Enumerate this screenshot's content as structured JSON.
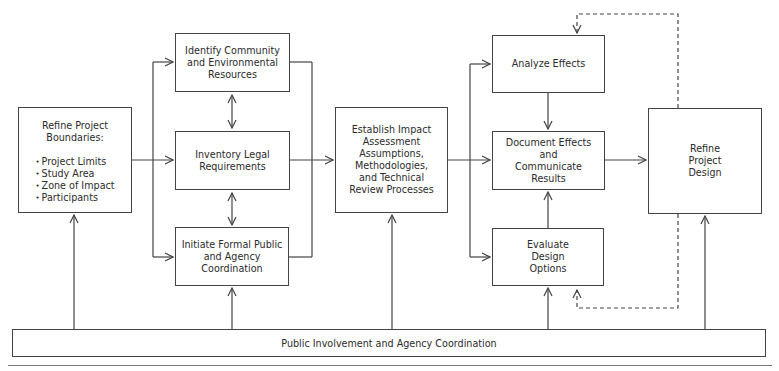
{
  "diagram": {
    "nodes": {
      "refine_boundaries": {
        "title": "Refine Project Boundaries:",
        "items": [
          "Project Limits",
          "Study Area",
          "Zone of Impact",
          "Participants"
        ]
      },
      "identify_resources": {
        "label": "Identify Community and Environmental Resources"
      },
      "inventory_legal": {
        "label": "Inventory Legal Requirements"
      },
      "initiate_coordination": {
        "label": "Initiate Formal Public and Agency Coordination"
      },
      "establish_assessment": {
        "label": "Establish Impact Assessment Assumptions, Methodologies, and Technical Review Processes"
      },
      "analyze_effects": {
        "label": "Analyze Effects"
      },
      "document_effects": {
        "label": "Document Effects and Communicate Results"
      },
      "evaluate_design": {
        "label": "Evaluate Design Options"
      },
      "refine_design": {
        "label": "Refine Project Design"
      },
      "public_involvement": {
        "label": "Public Involvement and Agency Coordination"
      }
    },
    "edges": [
      {
        "from": "refine_boundaries",
        "to": "identify_resources",
        "style": "solid"
      },
      {
        "from": "refine_boundaries",
        "to": "inventory_legal",
        "style": "solid"
      },
      {
        "from": "refine_boundaries",
        "to": "initiate_coordination",
        "style": "solid"
      },
      {
        "from": "identify_resources",
        "to": "inventory_legal",
        "style": "solid",
        "bidirectional": true
      },
      {
        "from": "inventory_legal",
        "to": "initiate_coordination",
        "style": "solid",
        "bidirectional": true
      },
      {
        "from": "identify_resources",
        "to": "establish_assessment",
        "style": "solid"
      },
      {
        "from": "inventory_legal",
        "to": "establish_assessment",
        "style": "solid"
      },
      {
        "from": "initiate_coordination",
        "to": "establish_assessment",
        "style": "solid"
      },
      {
        "from": "establish_assessment",
        "to": "analyze_effects",
        "style": "solid"
      },
      {
        "from": "establish_assessment",
        "to": "document_effects",
        "style": "solid"
      },
      {
        "from": "establish_assessment",
        "to": "evaluate_design",
        "style": "solid"
      },
      {
        "from": "analyze_effects",
        "to": "document_effects",
        "style": "solid"
      },
      {
        "from": "evaluate_design",
        "to": "document_effects",
        "style": "solid"
      },
      {
        "from": "document_effects",
        "to": "refine_design",
        "style": "solid"
      },
      {
        "from": "refine_design",
        "to": "analyze_effects",
        "style": "dashed"
      },
      {
        "from": "refine_design",
        "to": "evaluate_design",
        "style": "dashed"
      },
      {
        "from": "public_involvement",
        "to": "refine_boundaries",
        "style": "solid"
      },
      {
        "from": "public_involvement",
        "to": "initiate_coordination",
        "style": "solid"
      },
      {
        "from": "public_involvement",
        "to": "establish_assessment",
        "style": "solid"
      },
      {
        "from": "public_involvement",
        "to": "evaluate_design",
        "style": "solid"
      },
      {
        "from": "public_involvement",
        "to": "refine_design",
        "style": "solid"
      }
    ],
    "colors": {
      "line": "#444444",
      "text": "#2b2b2b",
      "background": "#ffffff"
    }
  }
}
